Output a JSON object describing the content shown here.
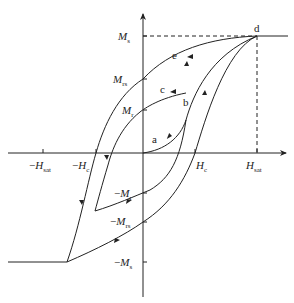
{
  "diagram": {
    "type": "magnetic-hysteresis-loop",
    "axes": {
      "x_axis": "H",
      "y_axis": "M"
    },
    "y_labels": [
      {
        "id": "Ms",
        "main": "M",
        "sub": "s",
        "prefix": ""
      },
      {
        "id": "Mrs",
        "main": "M",
        "sub": "rs",
        "prefix": ""
      },
      {
        "id": "Mr",
        "main": "M",
        "sub": "r",
        "prefix": ""
      },
      {
        "id": "neg-Mr",
        "main": "M",
        "sub": "r",
        "prefix": "−"
      },
      {
        "id": "neg-Mrs",
        "main": "M",
        "sub": "rs",
        "prefix": "−"
      },
      {
        "id": "neg-Ms",
        "main": "M",
        "sub": "s",
        "prefix": "−"
      }
    ],
    "x_labels": [
      {
        "id": "neg-Hsat",
        "main": "H",
        "sub": "sat",
        "prefix": "−"
      },
      {
        "id": "neg-Hc",
        "main": "H",
        "sub": "c",
        "prefix": "−"
      },
      {
        "id": "Hc",
        "main": "H",
        "sub": "c",
        "prefix": ""
      },
      {
        "id": "Hsat",
        "main": "H",
        "sub": "sat",
        "prefix": ""
      }
    ],
    "point_labels": {
      "a": "a",
      "b": "b",
      "c": "c",
      "d": "d",
      "e": "e"
    },
    "line_color": "#222222"
  }
}
